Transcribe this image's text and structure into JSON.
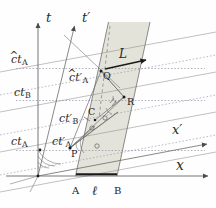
{
  "figure": {
    "kind": "minkowski-spacetime-diagram",
    "background": "#fefefe",
    "shade_color": "#e3e2d8",
    "line_color": "#6f6f6f",
    "axis_color": "#555555",
    "dotted_color": "#8a8a9a",
    "text_color": "#2a2a2a",
    "bold_color": "#1a1a1a"
  },
  "axes": {
    "t": {
      "label": "t",
      "kind": "time-axis-unprimed"
    },
    "tp": {
      "label": "t",
      "prime": "′",
      "kind": "time-axis-primed"
    },
    "x": {
      "label": "x",
      "kind": "space-axis-unprimed"
    },
    "xp": {
      "label": "x",
      "prime": "′",
      "kind": "space-axis-primed"
    }
  },
  "tick_labels": [
    {
      "id": "ct-hat-A",
      "base": "ct",
      "sub": "A",
      "hat": true,
      "prime": false,
      "text": "ĉt_A"
    },
    {
      "id": "ct-B",
      "base": "ct",
      "sub": "B",
      "hat": false,
      "prime": false,
      "text": "ct_B"
    },
    {
      "id": "ct-A",
      "base": "ct",
      "sub": "A",
      "hat": false,
      "prime": false,
      "text": "ct_A"
    },
    {
      "id": "ct-hat-A-prime",
      "base": "ct",
      "sub": "A",
      "hat": true,
      "prime": true,
      "text": "ĉt′_A"
    },
    {
      "id": "ct-B-prime",
      "base": "ct",
      "sub": "B",
      "hat": false,
      "prime": true,
      "text": "ct′_B"
    },
    {
      "id": "ct-A-prime",
      "base": "ct",
      "sub": "A",
      "hat": false,
      "prime": true,
      "text": "ct′_A"
    }
  ],
  "points": [
    {
      "id": "P",
      "label": "P"
    },
    {
      "id": "C",
      "label": "C"
    },
    {
      "id": "Q",
      "label": "Q"
    },
    {
      "id": "R",
      "label": "R"
    },
    {
      "id": "A",
      "label": "A"
    },
    {
      "id": "B",
      "label": "B"
    }
  ],
  "measures": [
    {
      "id": "L",
      "label": "L",
      "desc": "rod length in primed frame, arrow at ct-hat-A level"
    },
    {
      "id": "ell",
      "label": "ℓ",
      "desc": "rod rest length on x axis between A and B"
    }
  ]
}
